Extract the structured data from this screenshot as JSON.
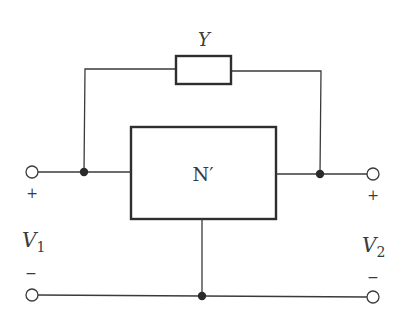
{
  "diagram": {
    "type": "two-port circuit",
    "admittance": {
      "label": "Y"
    },
    "network": {
      "label": "N′"
    },
    "port1": {
      "plus": "+",
      "minus": "−",
      "voltage": "V",
      "subscript": "1"
    },
    "port2": {
      "plus": "+",
      "minus": "−",
      "voltage": "V",
      "subscript": "2"
    },
    "colors": {
      "line": "#3a3a3a",
      "background": "#ffffff"
    }
  }
}
